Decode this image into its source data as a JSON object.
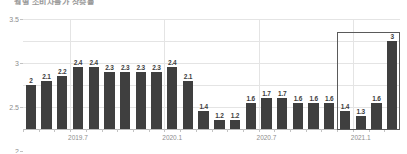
{
  "chart_title": "월별 소비자물가 상승률",
  "axis": {
    "y_ticks": [
      "3.5",
      "3",
      "2.5",
      "2",
      "1.5",
      "1"
    ],
    "y_tick_values": [
      3.5,
      3,
      2.5,
      2,
      1.5,
      1
    ],
    "x_tick_labels": [
      "2019.7",
      "2020.1",
      "2020.7",
      "2021.1"
    ],
    "x_tick_indices": [
      3,
      9,
      15,
      21
    ]
  },
  "highlight": {
    "start_index": 20,
    "end_index": 23,
    "color": "#5a5a5a"
  },
  "colors": {
    "bar": "#3f3f3f",
    "grid": "#e4e4e4",
    "axis_text": "#8d8d8d",
    "label_text": "#3d3d3d",
    "highlight": "#5a5a5a"
  },
  "chart_data": {
    "type": "bar",
    "title": "월별 소비자물가 상승률",
    "xlabel": "",
    "ylabel": "",
    "ylim": [
      1,
      3.5
    ],
    "grid": true,
    "legend": false,
    "categories": [
      "2019.4",
      "2019.5",
      "2019.6",
      "2019.7",
      "2019.8",
      "2019.9",
      "2019.10",
      "2019.11",
      "2019.12",
      "2020.1",
      "2020.2",
      "2020.3",
      "2020.4",
      "2020.5",
      "2020.6",
      "2020.7",
      "2020.8",
      "2020.9",
      "2020.10",
      "2020.11",
      "2020.12",
      "2021.1",
      "2021.2",
      "2021.3"
    ],
    "values": [
      2,
      2.1,
      2.2,
      2.4,
      2.4,
      2.3,
      2.3,
      2.3,
      2.3,
      2.4,
      2.1,
      1.4,
      1.2,
      1.2,
      1.6,
      1.7,
      1.7,
      1.6,
      1.6,
      1.6,
      1.4,
      1.3,
      1.6,
      3
    ],
    "data_labels": [
      "2",
      "2.1",
      "2.2",
      "2.4",
      "2.4",
      "2.3",
      "2.3",
      "2.3",
      "2.3",
      "2.4",
      "2.1",
      "1.4",
      "1.2",
      "1.2",
      "1.6",
      "1.7",
      "1.7",
      "1.6",
      "1.6",
      "1.6",
      "1.4",
      "1.3",
      "1.6",
      "3"
    ]
  }
}
